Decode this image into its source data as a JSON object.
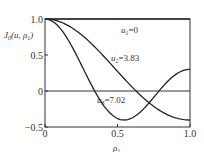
{
  "chart_data": {
    "type": "line",
    "title": "",
    "xlabel": "ρ1",
    "ylabel": "J0(u,ρ1)",
    "xlim": [
      0,
      1.0
    ],
    "ylim": [
      -0.5,
      1.0
    ],
    "xticks": [
      0,
      0.5,
      1.0
    ],
    "xtick_labels": [
      "0",
      "0.5",
      "1.0"
    ],
    "yticks": [
      1.0,
      0.5,
      0,
      -0.5
    ],
    "ytick_labels": [
      "1.0",
      "0.5",
      "0",
      "−0.5"
    ],
    "grid": false,
    "series": [
      {
        "name": "u1=0",
        "label_main": "u",
        "label_sub": "1",
        "label_rest": "=0",
        "u": 0,
        "x": [
          0,
          0.1,
          0.2,
          0.3,
          0.4,
          0.5,
          0.6,
          0.7,
          0.8,
          0.9,
          1.0
        ],
        "values": [
          1,
          1,
          1,
          1,
          1,
          1,
          1,
          1,
          1,
          1,
          1
        ]
      },
      {
        "name": "u2=3.83",
        "label_main": "u",
        "label_sub": "2",
        "label_rest": "=3.83",
        "u": 3.83,
        "x": [
          0,
          0.1,
          0.2,
          0.3,
          0.4,
          0.5,
          0.6,
          0.7,
          0.8,
          0.9,
          1.0
        ],
        "values": [
          1.0,
          0.964,
          0.861,
          0.699,
          0.497,
          0.279,
          0.072,
          -0.107,
          -0.245,
          -0.336,
          -0.403
        ]
      },
      {
        "name": "u3=7.02",
        "label_main": "u",
        "label_sub": "3",
        "label_rest": "=7.02",
        "u": 7.02,
        "x": [
          0,
          0.1,
          0.2,
          0.3,
          0.4,
          0.5,
          0.6,
          0.7,
          0.8,
          0.9,
          1.0
        ],
        "values": [
          1.0,
          0.88,
          0.555,
          0.131,
          -0.223,
          -0.384,
          -0.325,
          -0.109,
          0.132,
          0.275,
          0.3
        ]
      }
    ],
    "zero_line": true
  }
}
